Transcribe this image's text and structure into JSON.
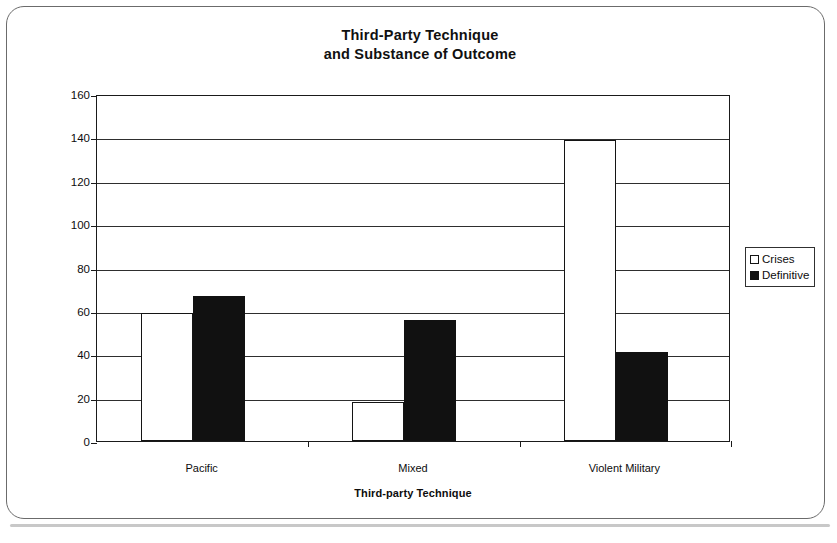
{
  "chart_data": {
    "type": "bar",
    "title": "Third-Party Technique and Substance of Outcome",
    "title_lines": [
      "Third-Party Technique",
      "and Substance of Outcome"
    ],
    "xlabel": "Third-party Technique",
    "ylabel": "Percentage of Crises",
    "categories": [
      "Pacific",
      "Mixed",
      "Violent Military"
    ],
    "ylim": [
      0,
      160
    ],
    "ytick_step": 20,
    "yticks": [
      0,
      20,
      40,
      60,
      80,
      100,
      120,
      140,
      160
    ],
    "ytick_labels": [
      "0",
      "20",
      "40",
      "60",
      "80",
      "100",
      "120",
      "140",
      "160"
    ],
    "grid": "horizontal",
    "legend_position": "right",
    "series": [
      {
        "name": "Crises",
        "style": "hollow",
        "color": "#ffffff",
        "edge_color": "#141414",
        "values": [
          59,
          18,
          139
        ]
      },
      {
        "name": "Definitive",
        "style": "filled",
        "color": "#111111",
        "edge_color": "#111111",
        "values": [
          67,
          56,
          41
        ]
      }
    ]
  },
  "legend": {
    "items": [
      {
        "label": "Crises",
        "swatch": "hollow-square-icon"
      },
      {
        "label": "Definitive",
        "swatch": "filled-square-icon"
      }
    ]
  }
}
